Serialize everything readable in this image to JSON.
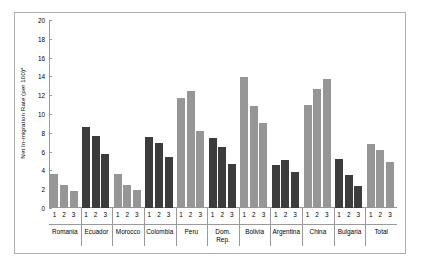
{
  "chart_data": {
    "type": "bar",
    "title": "",
    "xlabel": "",
    "ylabel": "Net In-migration Rate (per 100)*",
    "ylim": [
      0,
      20
    ],
    "ytick_step": 2,
    "yticks": [
      0,
      2,
      4,
      6,
      8,
      10,
      12,
      14,
      16,
      18,
      20
    ],
    "grid": false,
    "legend": "none",
    "categories": [
      "Romania",
      "Ecuador",
      "Morocco",
      "Colombia",
      "Peru",
      "Dom. Rep.",
      "Bolivia",
      "Argentina",
      "China",
      "Bulgaria",
      "Total"
    ],
    "subcategories": [
      "1",
      "2",
      "3"
    ],
    "colors": {
      "dark": "#3c3c3c",
      "light": "#969696",
      "axis": "#9a9a9a",
      "frame": "#b0b0b0",
      "background": "#ffffff"
    },
    "groups": [
      {
        "name": "Romania",
        "label_lines": [
          "Romania"
        ],
        "shade": "light",
        "values": [
          3.6,
          2.4,
          1.8
        ]
      },
      {
        "name": "Ecuador",
        "label_lines": [
          "Ecuador"
        ],
        "shade": "dark",
        "values": [
          8.6,
          7.7,
          5.7
        ]
      },
      {
        "name": "Morocco",
        "label_lines": [
          "Morocco"
        ],
        "shade": "light",
        "values": [
          3.6,
          2.4,
          1.9
        ]
      },
      {
        "name": "Colombia",
        "label_lines": [
          "Colombia"
        ],
        "shade": "dark",
        "values": [
          7.6,
          6.9,
          5.4
        ]
      },
      {
        "name": "Peru",
        "label_lines": [
          "Peru"
        ],
        "shade": "light",
        "values": [
          11.7,
          12.4,
          8.2
        ]
      },
      {
        "name": "Dom. Rep.",
        "label_lines": [
          "Dom.",
          "Rep."
        ],
        "shade": "dark",
        "values": [
          7.4,
          6.5,
          4.7
        ]
      },
      {
        "name": "Bolivia",
        "label_lines": [
          "Bolivia"
        ],
        "shade": "light",
        "values": [
          13.9,
          10.8,
          9.0
        ]
      },
      {
        "name": "Argentina",
        "label_lines": [
          "Argentina"
        ],
        "shade": "dark",
        "values": [
          4.6,
          5.1,
          3.8
        ]
      },
      {
        "name": "China",
        "label_lines": [
          "China"
        ],
        "shade": "light",
        "values": [
          11.0,
          12.7,
          13.7
        ]
      },
      {
        "name": "Bulgaria",
        "label_lines": [
          "Bulgaria"
        ],
        "shade": "dark",
        "values": [
          5.2,
          3.5,
          2.3
        ]
      },
      {
        "name": "Total",
        "label_lines": [
          "Total"
        ],
        "shade": "light",
        "values": [
          6.8,
          6.2,
          4.9
        ]
      }
    ]
  }
}
